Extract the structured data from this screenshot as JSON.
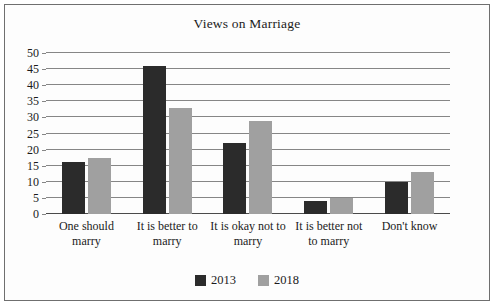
{
  "chart_data": {
    "type": "bar",
    "title": "Views on Marriage",
    "xlabel": "",
    "ylabel": "",
    "ylim": [
      0,
      50
    ],
    "yticks": [
      0,
      5,
      10,
      15,
      20,
      25,
      30,
      35,
      40,
      45,
      50
    ],
    "grid": true,
    "legend_position": "bottom-center",
    "categories": [
      "One should marry",
      "It is better to marry",
      "It is okay not to marry",
      "It is better not to marry",
      "Don't know"
    ],
    "series": [
      {
        "name": "2013",
        "color": "#2b2b2b",
        "values": [
          16,
          46,
          22,
          4,
          10
        ]
      },
      {
        "name": "2018",
        "color": "#a0a0a0",
        "values": [
          17.5,
          33,
          29,
          5,
          13
        ]
      }
    ]
  },
  "legend": {
    "items": [
      {
        "label": "2013"
      },
      {
        "label": "2018"
      }
    ]
  }
}
